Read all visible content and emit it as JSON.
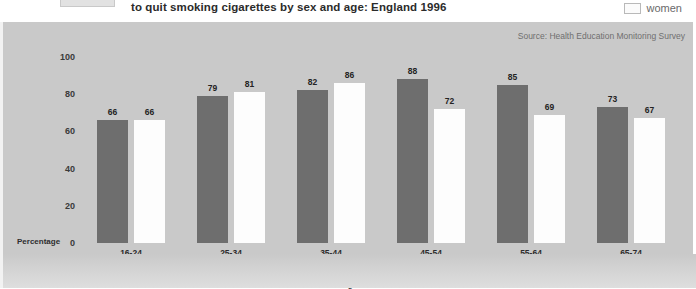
{
  "header": {
    "title": "to quit smoking cigarettes by sex and age: England 1996",
    "legend_women_label": "women",
    "legend_women_swatch_color": "#fdfdfd"
  },
  "panel": {
    "source": "Source: Health Education Monitoring Survey",
    "background_color": "#c9c9c9"
  },
  "chart_data": {
    "type": "bar",
    "title": "to quit smoking cigarettes by sex and age: England 1996",
    "subtitle": "",
    "source": "Source: Health Education Monitoring Survey",
    "categories": [
      "16-24",
      "25-34",
      "35-44",
      "45-54",
      "55-64",
      "65-74"
    ],
    "series": [
      {
        "name": "men",
        "color": "#6e6e6e",
        "values": [
          66,
          79,
          82,
          88,
          85,
          73
        ]
      },
      {
        "name": "women",
        "color": "#fdfdfd",
        "values": [
          66,
          81,
          86,
          72,
          69,
          67
        ]
      }
    ],
    "xlabel": "Age",
    "ylabel": "Percentage",
    "yticks": [
      0,
      20,
      40,
      60,
      80,
      100
    ],
    "ylim": [
      0,
      100
    ],
    "grid": false,
    "legend_position": "top-right",
    "legend_entries": [
      "women"
    ],
    "data_labels": true
  }
}
